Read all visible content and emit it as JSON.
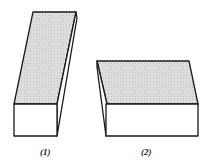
{
  "figures": [
    {
      "id": "1",
      "label": "(1)",
      "description": "tall narrow box tilted, shaded top face",
      "top_face": [
        [
          33,
          12
        ],
        [
          76,
          12
        ],
        [
          57,
          104
        ],
        [
          14,
          104
        ]
      ],
      "side_face": [
        [
          76,
          12
        ],
        [
          77,
          18
        ],
        [
          57,
          136
        ],
        [
          57,
          104
        ]
      ],
      "front_face": [
        [
          14,
          104
        ],
        [
          57,
          104
        ],
        [
          57,
          136
        ],
        [
          14,
          136
        ]
      ],
      "label_pos": [
        40,
        148
      ]
    },
    {
      "id": "2",
      "label": "(2)",
      "description": "wide flat box, shaded top face",
      "top_face": [
        [
          97,
          61
        ],
        [
          189,
          61
        ],
        [
          198,
          104
        ],
        [
          107,
          104
        ]
      ],
      "side_face": [
        [
          97,
          61
        ],
        [
          97,
          67
        ],
        [
          106,
          136
        ],
        [
          107,
          104
        ]
      ],
      "front_face": [
        [
          106,
          104
        ],
        [
          198,
          104
        ],
        [
          198,
          136
        ],
        [
          106,
          136
        ]
      ],
      "label_pos": [
        141,
        148
      ]
    }
  ],
  "colors": {
    "stroke": "#1a1a1a",
    "shade": "#d4d4d4",
    "face": "#ffffff"
  }
}
